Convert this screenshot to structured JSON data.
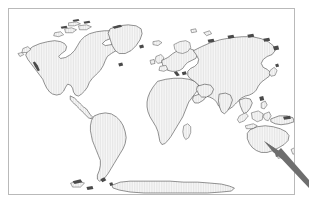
{
  "figure": {
    "kind": "world-map-figure",
    "title": "",
    "width": 309,
    "height": 209,
    "background_color": "#ffffff"
  },
  "frame": {
    "border_color": "#b9b9b9",
    "border_width": 1,
    "x": 8,
    "y": 8,
    "width": 287,
    "height": 187
  },
  "map": {
    "projection": "equirectangular",
    "ocean_color": "#ffffff",
    "land_fill_color": "#f2f2f2",
    "land_hatch_color": "#dcdcdc",
    "coastline_color": "#3a3a3a",
    "coastline_width": 0.55,
    "graticule": "none",
    "labels": "none",
    "continents": [
      "North America",
      "South America",
      "Greenland",
      "Europe",
      "Africa",
      "Asia",
      "Australia",
      "Antarctica",
      "Indonesia",
      "Japan",
      "Madagascar",
      "New Zealand",
      "British Isles",
      "Iceland"
    ]
  },
  "annotation": {
    "type": "arrow",
    "color": "#6e6e6e",
    "points_to": "Australia / New Guinea",
    "tail_x": 309,
    "tail_y": 185,
    "head_x": 265,
    "head_y": 142,
    "label": ""
  }
}
